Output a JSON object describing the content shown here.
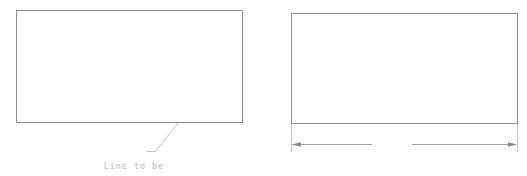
{
  "canvas": {
    "width": 527,
    "height": 176,
    "background": "#ffffff",
    "line_color": "#8d8d8d",
    "text_color": "#b9b9b9"
  },
  "figures": [
    {
      "id": "before",
      "shape_name": "rectangle",
      "annotation": {
        "type": "leader-note",
        "line1": "Line to be",
        "line2": "selected"
      }
    },
    {
      "id": "after",
      "shape_name": "rectangle",
      "annotation": {
        "type": "linear-dimension",
        "value": "112"
      }
    }
  ],
  "left_figure": {
    "rect_name": "source-rectangle",
    "leader": {
      "label_line1": "Line to be",
      "label_line2": "selected"
    }
  },
  "right_figure": {
    "rect_name": "dimensioned-rectangle",
    "dimension": {
      "value": "112",
      "orientation": "horizontal",
      "arrowheads": "both-ends"
    }
  }
}
